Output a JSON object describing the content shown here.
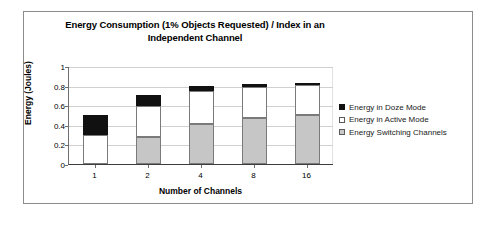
{
  "chart_data": {
    "type": "bar",
    "subtype": "stacked-bar",
    "title": "Energy Consumption (1% Objects Requested) / Index in an Independent Channel",
    "title_line1": "Energy Consumption (1% Objects Requested) / Index in an",
    "title_line2": "Independent Channel",
    "xlabel": "Number of Channels",
    "ylabel": "Energy (Joules)",
    "categories": [
      "1",
      "2",
      "4",
      "8",
      "16"
    ],
    "ylim": [
      0,
      1
    ],
    "yticks": [
      0,
      0.2,
      0.4,
      0.6,
      0.8,
      1
    ],
    "ytick_labels": [
      "0",
      "0.2",
      "0.4",
      "0.6",
      "0.8",
      "1"
    ],
    "grid": true,
    "grid_axis": "y",
    "legend_position": "right",
    "stack_order_bottom_to_top": [
      "Energy Switching Channels",
      "Energy in Active Mode",
      "Energy in Doze Mode"
    ],
    "series": [
      {
        "name": "Energy Switching Channels",
        "color": "#c6c6c6",
        "values": [
          0,
          0.28,
          0.41,
          0.47,
          0.5
        ]
      },
      {
        "name": "Energy in Active Mode",
        "color": "#ffffff",
        "values": [
          0.3,
          0.31,
          0.34,
          0.32,
          0.305
        ]
      },
      {
        "name": "Energy in Doze Mode",
        "color": "#111111",
        "values": [
          0.2,
          0.11,
          0.05,
          0.03,
          0.02
        ]
      }
    ],
    "totals": [
      0.5,
      0.7,
      0.8,
      0.82,
      0.825
    ],
    "legend_entries": [
      {
        "label": "Energy in Doze Mode",
        "color": "#111111"
      },
      {
        "label": "Energy in Active Mode",
        "color": "#ffffff"
      },
      {
        "label": "Energy Switching Channels",
        "color": "#c9c9c9"
      }
    ]
  },
  "colors": {
    "frame": "#8c8c8c",
    "grid": "#d0d0d0",
    "axis": "#3d3d3d",
    "bar_outline": "#7a7a7a",
    "background": "#ffffff"
  }
}
